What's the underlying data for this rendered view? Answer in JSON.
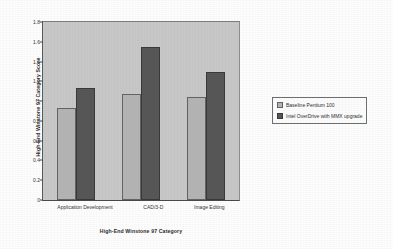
{
  "chart_data": {
    "type": "bar",
    "title": "",
    "categories": [
      "Application Development",
      "CAD/3-D",
      "Image Editing"
    ],
    "series": [
      {
        "name": "Baseline Pentium 100",
        "values": [
          0.93,
          1.07,
          1.04
        ],
        "color": "#b4b4b4"
      },
      {
        "name": "Intel OverDrive with MMX upgrade",
        "values": [
          1.13,
          1.55,
          1.29
        ],
        "color": "#575757"
      }
    ],
    "xlabel": "High-End Winstone 97 Category",
    "ylabel": "High-End Winstone 97 Category Score",
    "ylim": [
      0,
      1.8
    ],
    "ytick_labels": [
      "0",
      "0.2",
      "0.4",
      "0.6",
      "0.8",
      "1",
      "1.2",
      "1.4",
      "1.6",
      "1.8"
    ],
    "ytick_values": [
      0,
      0.2,
      0.4,
      0.6,
      0.8,
      1.0,
      1.2,
      1.4,
      1.6,
      1.8
    ],
    "grid": false,
    "legend_position": "right"
  }
}
